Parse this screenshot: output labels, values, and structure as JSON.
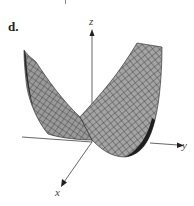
{
  "figure": {
    "panel_label": "d.",
    "axes": {
      "x_label": "x",
      "y_label": "y",
      "z_label": "z"
    },
    "surface": {
      "type": "wireframe-mesh",
      "description": "saddle-like surface with two raised wings and a valley",
      "fill_color": "#9a9a9a",
      "mesh_color": "#3a3a3a"
    },
    "axis_color": "#555555"
  }
}
